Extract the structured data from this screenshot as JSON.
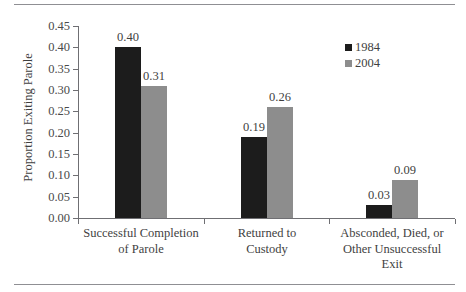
{
  "chart_data": {
    "type": "bar",
    "title": "",
    "xlabel": "",
    "ylabel": "Proportion Exiting Parole",
    "ylim": [
      0.0,
      0.45
    ],
    "ytick_labels": [
      "0.45",
      "0.40",
      "0.35",
      "0.30",
      "0.25",
      "0.20",
      "0.15",
      "0.10",
      "0.05",
      "0.00"
    ],
    "ytick_values": [
      0.45,
      0.4,
      0.35,
      0.3,
      0.25,
      0.2,
      0.15,
      0.1,
      0.05,
      0.0
    ],
    "grid": false,
    "legend_position": "top-right",
    "categories": [
      "Successful Completion of Parole",
      "Returned to Custody",
      "Absconded, Died, or Other Unsuccessful Exit"
    ],
    "category_lines": [
      [
        "Successful Completion",
        "of Parole"
      ],
      [
        "Returned to",
        "Custody"
      ],
      [
        "Absconded, Died, or",
        "Other Unsuccessful",
        "Exit"
      ]
    ],
    "series": [
      {
        "name": "1984",
        "color": "#1c1c1c",
        "values": [
          0.4,
          0.19,
          0.03
        ],
        "labels": [
          "0.40",
          "0.19",
          "0.03"
        ]
      },
      {
        "name": "2004",
        "color": "#8d8d8d",
        "values": [
          0.31,
          0.26,
          0.09
        ],
        "labels": [
          "0.31",
          "0.26",
          "0.09"
        ]
      }
    ]
  },
  "legend": {
    "items": [
      {
        "label": "1984",
        "color": "#1c1c1c"
      },
      {
        "label": "2004",
        "color": "#8d8d8d"
      }
    ]
  },
  "axis": {
    "y_title": "Proportion Exiting Parole"
  }
}
